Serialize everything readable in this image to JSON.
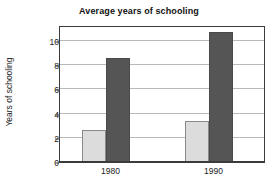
{
  "chart_data": {
    "type": "bar",
    "title": "Average years of schooling",
    "xlabel": "",
    "ylabel": "Years of schooling",
    "categories": [
      "1980",
      "1990"
    ],
    "series": [
      {
        "name": "light-series",
        "color": "#dcdcdc",
        "values": [
          2.65,
          3.4
        ]
      },
      {
        "name": "dark-series",
        "color": "#555555",
        "values": [
          8.6,
          10.7
        ]
      }
    ],
    "ylim": [
      0,
      11.3
    ],
    "yticks": [
      0,
      2,
      4,
      6,
      8,
      10
    ],
    "ytick_labels": [
      "0",
      "2",
      "4",
      "6",
      "8",
      "10"
    ],
    "grid": true,
    "grid_axis": "y",
    "legend": false,
    "legend_position": "none",
    "bar_style": "grouped",
    "background": "#ffffff",
    "frame_color": "#3b3b3b",
    "gridline_color": "#b9b9b9"
  }
}
